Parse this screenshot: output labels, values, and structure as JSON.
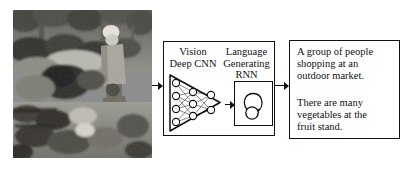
{
  "figure": {
    "type": "image-captioning-pipeline-diagram",
    "input_image": {
      "name": "outdoor-market-photo",
      "description": "Grayscale photograph of people at an outdoor market with produce piled in the foreground",
      "color_mode": "grayscale"
    },
    "model_box": {
      "vision_label": "Vision\nDeep CNN",
      "language_label": "Language\nGenerating\nRNN",
      "cnn": {
        "icon_name": "cnn-triangle-network",
        "layers": [
          4,
          3,
          2
        ]
      },
      "rnn": {
        "icon_name": "rnn-recurrent-loop"
      }
    },
    "caption_box": {
      "lines": [
        "A group of people\nshopping at an\noutdoor market.",
        "There are many\nvegetables at the\nfruit stand."
      ]
    },
    "arrows": [
      {
        "name": "photo-to-model",
        "label": ""
      },
      {
        "name": "cnn-to-rnn",
        "label": ""
      },
      {
        "name": "model-to-caption",
        "label": ""
      }
    ],
    "colors": {
      "stroke": "#111111",
      "background": "#ffffff",
      "text": "#111111"
    }
  }
}
